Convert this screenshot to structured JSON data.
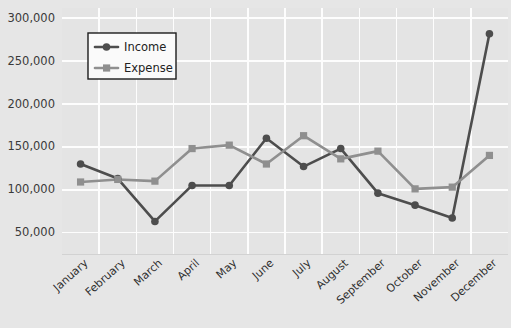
{
  "chart_data": {
    "type": "line",
    "title": "",
    "xlabel": "",
    "ylabel": "",
    "categories": [
      "January",
      "February",
      "March",
      "April",
      "May",
      "June",
      "July",
      "August",
      "September",
      "October",
      "November",
      "December"
    ],
    "series": [
      {
        "name": "Income",
        "color": "#4d4d4d",
        "marker": "circle",
        "values": [
          130000,
          113000,
          63000,
          105000,
          105000,
          160000,
          127000,
          148000,
          96000,
          82000,
          67000,
          282000
        ]
      },
      {
        "name": "Expense",
        "color": "#8f8f8f",
        "marker": "square",
        "values": [
          109000,
          112000,
          110000,
          148000,
          152000,
          130000,
          163000,
          136000,
          145000,
          101000,
          103000,
          140000
        ]
      }
    ],
    "ylim": [
      25000,
      312000
    ],
    "yticks": [
      50000,
      100000,
      150000,
      200000,
      250000,
      300000
    ],
    "ytick_labels": [
      "50,000",
      "100,000",
      "150,000",
      "200,000",
      "250,000",
      "300,000"
    ],
    "grid": true,
    "legend_position": "top-left-inside",
    "colors": {
      "page_background": "#e6e6e6",
      "plot_background": "#e4e4e4",
      "gridline": "#fdfdfd",
      "income": "#4d4d4d",
      "expense": "#8f8f8f",
      "text": "#2e2e2e"
    }
  },
  "legend": {
    "items": [
      {
        "label": "Income"
      },
      {
        "label": "Expense"
      }
    ]
  }
}
